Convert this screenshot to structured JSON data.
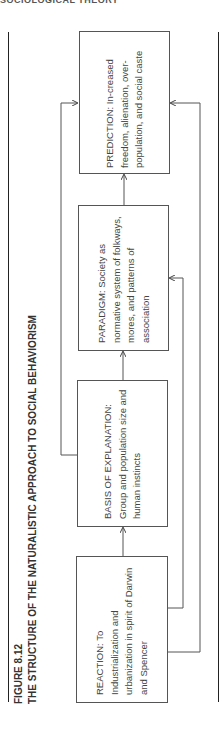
{
  "running_header": "SOCIOLOGICAL THEORY",
  "figure": {
    "label": "FIGURE 8.12",
    "title": "THE STRUCTURE OF THE NATURALISTIC APPROACH TO SOCIAL BEHAVIORISM"
  },
  "boxes": [
    {
      "id": "reaction",
      "text": "REACTION: To Industrialization and urbanization in spirit of Darwin and Spencer"
    },
    {
      "id": "basis",
      "text": "BASIS OF EXPLANATION: Group and population size and human instincts"
    },
    {
      "id": "paradigm",
      "text": "PARADIGM: Society as normative system of folkways, mores, and patterns of association"
    },
    {
      "id": "prediction",
      "text": "PREDICTION: In-creased freedom, alienation, over-population, and social caste"
    }
  ],
  "connections": [
    {
      "from": "reaction",
      "to": "basis"
    },
    {
      "from": "basis",
      "to": "paradigm"
    },
    {
      "from": "paradigm",
      "to": "prediction"
    },
    {
      "from": "basis",
      "to": "prediction"
    },
    {
      "from": "reaction",
      "to": "paradigm"
    },
    {
      "from": "reaction",
      "to": "prediction"
    }
  ],
  "colors": {
    "line": "#555555",
    "rule": "#222222",
    "text": "#444444"
  }
}
